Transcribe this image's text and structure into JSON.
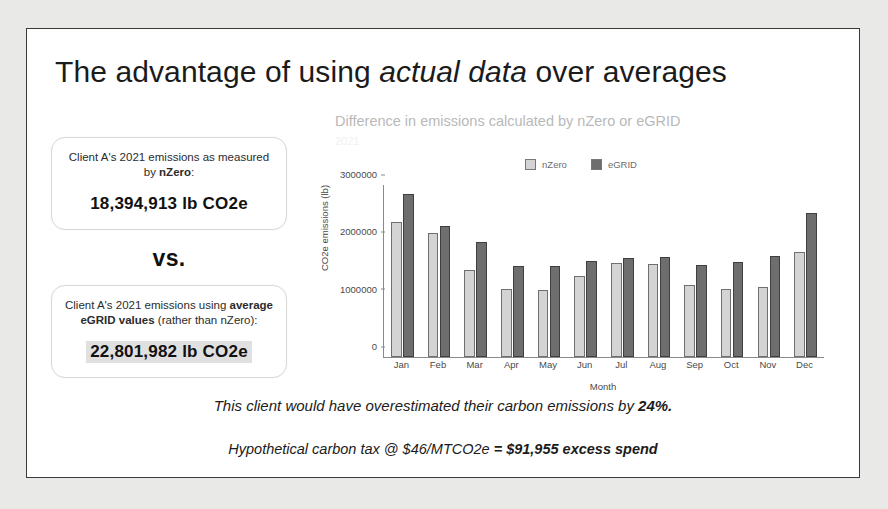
{
  "slide": {
    "title_prefix": "The advantage of using ",
    "title_emphasis": "actual data",
    "title_suffix": " over averages"
  },
  "left_panel": {
    "card1": {
      "lead_pre": "Client A's 2021 emissions as measured by ",
      "lead_bold": "nZero",
      "lead_post": ":",
      "value": "18,394,913 lb CO2e"
    },
    "vs_label": "vs.",
    "card2": {
      "lead_pre": "Client A's 2021 emissions using ",
      "lead_bold": "average eGRID values",
      "lead_post": " (rather than nZero):",
      "value": "22,801,982 lb CO2e"
    }
  },
  "footer": {
    "line1_pre": "This client would have overestimated their carbon emissions by ",
    "line1_bold": "24%.",
    "line2_pre": "Hypothetical carbon tax @ $46/MTCO2e ",
    "line2_bold": "= $91,955 excess spend"
  },
  "colors": {
    "nzero_bar": "#d4d4d4",
    "egrid_bar": "#6e6e6e",
    "slide_border": "#3a3a3a",
    "page_background": "#e9e9e7"
  },
  "chart_data": {
    "type": "bar",
    "title": "Difference in emissions calculated by nZero or eGRID",
    "subtitle": "2021",
    "xlabel": "Month",
    "ylabel": "CO2e emissions (lb)",
    "ylim": [
      0,
      3000000
    ],
    "yticks": [
      0,
      1000000,
      2000000,
      3000000
    ],
    "ytick_labels": [
      "0",
      "1000000",
      "2000000",
      "3000000"
    ],
    "grid": false,
    "legend_position": "top-center",
    "categories": [
      "Jan",
      "Feb",
      "Mar",
      "Apr",
      "May",
      "Jun",
      "Jul",
      "Aug",
      "Sep",
      "Oct",
      "Nov",
      "Dec"
    ],
    "series": [
      {
        "name": "nZero",
        "color": "#d4d4d4",
        "values": [
          2350000,
          2170000,
          1520000,
          1180000,
          1170000,
          1420000,
          1640000,
          1630000,
          1250000,
          1190000,
          1220000,
          1830000
        ]
      },
      {
        "name": "eGRID",
        "color": "#6e6e6e",
        "values": [
          2840000,
          2280000,
          2000000,
          1580000,
          1580000,
          1670000,
          1730000,
          1750000,
          1600000,
          1650000,
          1760000,
          2510000
        ]
      }
    ]
  }
}
